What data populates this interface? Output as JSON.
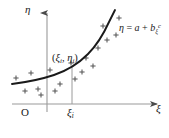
{
  "figure": {
    "kind": "scatter-with-fitted-curve",
    "background_color": "#ffffff",
    "ink_color": "#1a1a1a",
    "axis_color": "#8a8a8a",
    "curve_color": "#1a1a1a",
    "marker_color": "#555555",
    "width": 169,
    "height": 138
  },
  "axes": {
    "vertical": {
      "name": "eta-axis",
      "label": "η",
      "arrow": true,
      "x": 47,
      "y_top": 12,
      "y_bottom": 112
    },
    "horizontal": {
      "name": "xi-axis",
      "label": "ξ",
      "arrow": true,
      "y": 104,
      "x_left": 12,
      "x_right": 158
    },
    "origin_label": "O"
  },
  "ticks": {
    "x": [
      {
        "label": "ξ",
        "subscript": "i",
        "x": 72
      }
    ]
  },
  "annotations": {
    "point_label": {
      "open": "(",
      "x_symbol": "ξ",
      "x_subscript": "i",
      "comma": ", ",
      "y_symbol": "η",
      "y_subscript": "i",
      "close": ")",
      "text": "(ξᵢ, ηᵢ)"
    },
    "curve_equation": {
      "lhs": "η",
      "equals": " = ",
      "a_term": "a",
      "plus": " + ",
      "b_term": "b",
      "b_subscript": "ξ",
      "exponent": "c",
      "text": "η = a + bξᶜ"
    }
  },
  "dropline": {
    "name": "xi-i-dropline",
    "x": 72,
    "y_top": 66,
    "y_bottom": 104
  },
  "chart_data": {
    "type": "scatter",
    "title": "",
    "xlabel": "ξ",
    "ylabel": "η",
    "curve_label": "η = a + bξᶜ",
    "grid": false,
    "legend": false,
    "curve_path": "M 12,84 C 28,82 42,79 54,75 C 66,71 78,64 88,54 C 97,45 104,33 109,22 C 112,16 114,12 115,10",
    "marker_glyph": "+",
    "points": [
      {
        "x": 16,
        "y": 78
      },
      {
        "x": 25,
        "y": 91
      },
      {
        "x": 31,
        "y": 73
      },
      {
        "x": 38,
        "y": 89
      },
      {
        "x": 41,
        "y": 95
      },
      {
        "x": 50,
        "y": 70
      },
      {
        "x": 55,
        "y": 91
      },
      {
        "x": 60,
        "y": 84
      },
      {
        "x": 71,
        "y": 63
      },
      {
        "x": 75,
        "y": 79
      },
      {
        "x": 82,
        "y": 72
      },
      {
        "x": 86,
        "y": 58
      },
      {
        "x": 93,
        "y": 66
      },
      {
        "x": 98,
        "y": 48
      },
      {
        "x": 103,
        "y": 26
      },
      {
        "x": 107,
        "y": 40
      },
      {
        "x": 116,
        "y": 35
      },
      {
        "x": 119,
        "y": 18
      }
    ]
  }
}
